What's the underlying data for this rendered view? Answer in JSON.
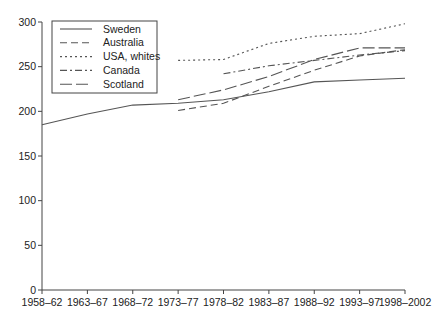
{
  "chart_data": {
    "type": "line",
    "title": "",
    "xlabel": "",
    "ylabel": "",
    "ylim": [
      0,
      300
    ],
    "yticks": [
      0,
      50,
      100,
      150,
      200,
      250,
      300
    ],
    "grid": false,
    "legend_position": "upper left",
    "categories": [
      "1958–62",
      "1963–67",
      "1968–72",
      "1973–77",
      "1978–82",
      "1983–87",
      "1988–92",
      "1993–97",
      "1998–2002"
    ],
    "series": [
      {
        "name": "Sweden",
        "style": "solid",
        "values": [
          185,
          197,
          207,
          209,
          213,
          222,
          233,
          235,
          237
        ]
      },
      {
        "name": "Australia",
        "style": "dashed",
        "values": [
          null,
          null,
          null,
          201,
          209,
          228,
          246,
          262,
          269
        ]
      },
      {
        "name": "USA, whites",
        "style": "dotted",
        "values": [
          null,
          null,
          null,
          257,
          258,
          276,
          284,
          287,
          298
        ]
      },
      {
        "name": "Canada",
        "style": "dashdot",
        "values": [
          null,
          null,
          null,
          null,
          242,
          251,
          257,
          263,
          268
        ]
      },
      {
        "name": "Scotland",
        "style": "longdash",
        "values": [
          null,
          null,
          null,
          213,
          224,
          239,
          258,
          271,
          271
        ]
      }
    ]
  },
  "colors": {
    "line": "#555555",
    "axis": "#444444"
  }
}
